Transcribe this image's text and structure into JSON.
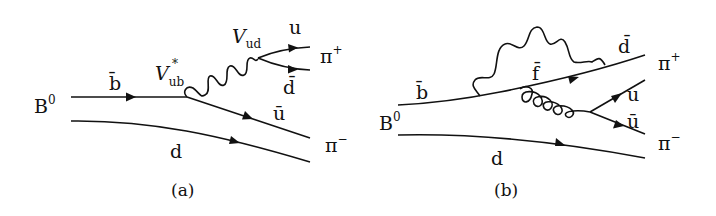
{
  "diagrams": [
    {
      "id": "a",
      "caption": "(a)",
      "meson_in": "B",
      "meson_in_sup": "0",
      "labels": {
        "b_quark": "b̄",
        "vub": "V",
        "vub_sub": "ub",
        "vub_sup": "*",
        "vud": "V",
        "vud_sub": "ud",
        "u_quark": "u",
        "dbar_quark": "d̄",
        "ubar_quark": "ū",
        "d_quark": "d",
        "pi_plus": "π",
        "pi_plus_sup": "+",
        "pi_minus": "π",
        "pi_minus_sup": "−"
      },
      "description": "Tree diagram: b̄ → ū W⁺, W⁺ → u d̄ forming π⁺; spectator d with ū forming π⁻"
    },
    {
      "id": "b",
      "caption": "(b)",
      "meson_in": "B",
      "meson_in_sup": "0",
      "labels": {
        "b_quark": "b̄",
        "f_quark": "f̄",
        "dbar_quark": "d̄",
        "u_quark": "u",
        "ubar_quark": "ū",
        "d_quark": "d",
        "pi_plus": "π",
        "pi_plus_sup": "+",
        "pi_minus": "π",
        "pi_minus_sup": "−"
      },
      "description": "Penguin diagram: b̄ → f̄ loop with W emission/absorption, gluon → u ū; spectator d"
    }
  ]
}
